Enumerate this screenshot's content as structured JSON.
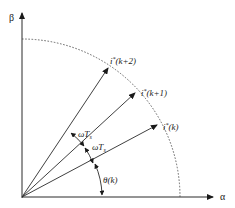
{
  "diagram": {
    "type": "space-vector diagram (alpha-beta plane)",
    "axes": {
      "x_label": "α",
      "y_label": "β"
    },
    "vectors": [
      {
        "id": "i_k",
        "label_base": "i",
        "label_sup": "*",
        "label_arg": "(k)",
        "angle_deg": 25
      },
      {
        "id": "i_k1",
        "label_base": "i",
        "label_sup": "*",
        "label_arg": "(k+1)",
        "angle_deg": 38
      },
      {
        "id": "i_k2",
        "label_base": "i",
        "label_sup": "*",
        "label_arg": "(k+2)",
        "angle_deg": 51
      }
    ],
    "angles": [
      {
        "id": "theta_k",
        "label": "θ(k)",
        "between": [
          "α-axis",
          "i*(k)"
        ]
      },
      {
        "id": "omega_ts_1",
        "label_base": "ωT",
        "label_sub": "s",
        "between": [
          "i*(k)",
          "i*(k+1)"
        ]
      },
      {
        "id": "omega_ts_2",
        "label_base": "ωT",
        "label_sub": "s",
        "between": [
          "i*(k+1)",
          "i*(k+2)"
        ]
      }
    ],
    "reference_circle": {
      "style": "dashed",
      "extent": "quarter circle, first quadrant"
    }
  }
}
